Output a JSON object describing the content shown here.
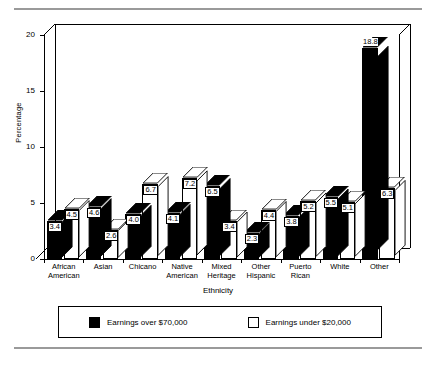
{
  "chart_data": {
    "type": "bar",
    "title": "",
    "xlabel": "Ethnicity",
    "ylabel": "Percentage",
    "ylim": [
      0,
      20
    ],
    "yticks": [
      0,
      5,
      10,
      15,
      20
    ],
    "grid": false,
    "legend_position": "bottom",
    "style": "3d-grouped-bar",
    "categories": [
      "African American",
      "Asian",
      "Chicano",
      "Native American",
      "Mixed Heritage",
      "Other Hispanic",
      "Puerto Rican",
      "White",
      "Other"
    ],
    "category_lines": [
      [
        "African",
        "American"
      ],
      [
        "Asian"
      ],
      [
        "Chicano"
      ],
      [
        "Native",
        "American"
      ],
      [
        "Mixed",
        "Heritage"
      ],
      [
        "Other",
        "Hispanic"
      ],
      [
        "Puerto",
        "Rican"
      ],
      [
        "White"
      ],
      [
        "Other"
      ]
    ],
    "series": [
      {
        "name": "Earnings over $70,000",
        "color": "#000000",
        "values": [
          3.4,
          4.6,
          4.0,
          4.1,
          6.5,
          2.3,
          3.8,
          5.5,
          18.8
        ]
      },
      {
        "name": "Earnings under $20,000",
        "color": "#ffffff",
        "values": [
          4.5,
          2.6,
          6.7,
          7.2,
          3.4,
          4.4,
          5.2,
          5.1,
          6.3
        ]
      }
    ]
  },
  "legend": {
    "items": [
      {
        "label": "Earnings over $70,000",
        "swatch": "black"
      },
      {
        "label": "Earnings under $20,000",
        "swatch": "white"
      }
    ]
  }
}
